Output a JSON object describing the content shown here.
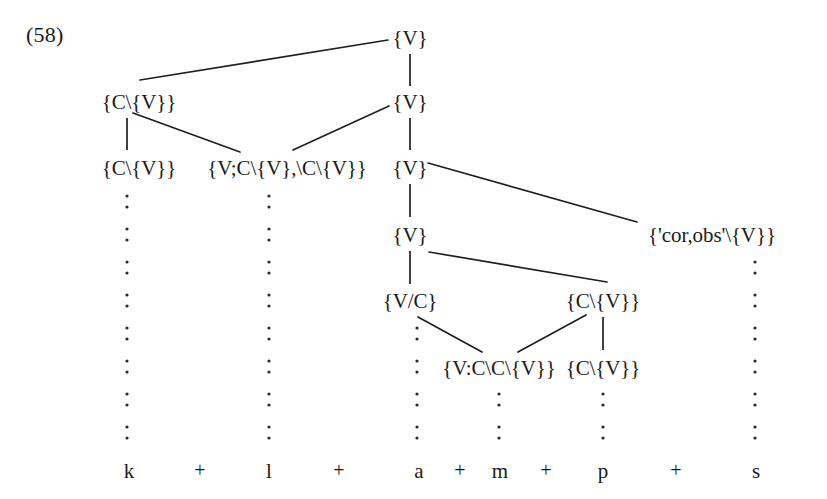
{
  "figure": {
    "example_number": "(58)",
    "ink_color": "#1f1f1f",
    "background_color": "#ffffff"
  },
  "nodes": [
    {
      "id": "n-root-v",
      "label": "{V}",
      "x": 410,
      "y": 38
    },
    {
      "id": "n-c-v-a",
      "label": "{C\\{V}}",
      "x": 139,
      "y": 102
    },
    {
      "id": "n-v-b",
      "label": "{V}",
      "x": 410,
      "y": 102
    },
    {
      "id": "n-c-v-b",
      "label": "{C\\{V}}",
      "x": 139,
      "y": 168
    },
    {
      "id": "n-v-cluster",
      "label": "{V;C\\{V},\\C\\{V}}",
      "x": 287,
      "y": 168
    },
    {
      "id": "n-v-c",
      "label": "{V}",
      "x": 410,
      "y": 168
    },
    {
      "id": "n-v-d",
      "label": "{V}",
      "x": 410,
      "y": 235
    },
    {
      "id": "n-cor-obs",
      "label": "{'cor,obs'\\{V}}",
      "x": 712,
      "y": 235
    },
    {
      "id": "n-v-slash-c",
      "label": "{V/C}",
      "x": 410,
      "y": 301
    },
    {
      "id": "n-c-v-c",
      "label": "{C\\{V}}",
      "x": 603,
      "y": 301
    },
    {
      "id": "n-v-ccv",
      "label": "{V:C\\C\\{V}}",
      "x": 499,
      "y": 368
    },
    {
      "id": "n-c-v-d",
      "label": "{C\\{V}}",
      "x": 603,
      "y": 368
    }
  ],
  "edges": [
    {
      "id": "e-root-to-cva",
      "kind": "diagonal",
      "x1": 388,
      "y1": 40,
      "x2": 140,
      "y2": 80
    },
    {
      "id": "e-root-stem",
      "kind": "stem",
      "x1": 410,
      "y1": 54,
      "x2": 410,
      "y2": 86
    },
    {
      "id": "e-vb-stem",
      "kind": "stem",
      "x1": 410,
      "y1": 118,
      "x2": 410,
      "y2": 150
    },
    {
      "id": "e-vb-to-cluster",
      "kind": "diagonal",
      "x1": 389,
      "y1": 106,
      "x2": 293,
      "y2": 150
    },
    {
      "id": "e-cva-stem",
      "kind": "stem",
      "x1": 127,
      "y1": 118,
      "x2": 127,
      "y2": 150
    },
    {
      "id": "e-cva-to-clu",
      "kind": "diagonal",
      "x1": 133,
      "y1": 113,
      "x2": 240,
      "y2": 152
    },
    {
      "id": "e-vc-stem",
      "kind": "stem",
      "x1": 410,
      "y1": 184,
      "x2": 410,
      "y2": 217
    },
    {
      "id": "e-vc-to-cor",
      "kind": "diagonal",
      "x1": 428,
      "y1": 163,
      "x2": 637,
      "y2": 222
    },
    {
      "id": "e-vd-stem",
      "kind": "stem",
      "x1": 410,
      "y1": 251,
      "x2": 410,
      "y2": 284
    },
    {
      "id": "e-vd-to-cvc",
      "kind": "diagonal",
      "x1": 429,
      "y1": 252,
      "x2": 607,
      "y2": 282
    },
    {
      "id": "e-vslashc-to-ccv",
      "kind": "diagonal",
      "x1": 418,
      "y1": 317,
      "x2": 482,
      "y2": 352
    },
    {
      "id": "e-cvc-to-ccv",
      "kind": "diagonal",
      "x1": 586,
      "y1": 315,
      "x2": 518,
      "y2": 352
    },
    {
      "id": "e-cvc-stem",
      "kind": "stem",
      "x1": 603,
      "y1": 317,
      "x2": 603,
      "y2": 350
    }
  ],
  "dotted_columns": [
    {
      "id": "dc-k",
      "x": 127,
      "y_start": 196,
      "y_end": 450
    },
    {
      "id": "dc-l",
      "x": 269,
      "y_start": 196,
      "y_end": 450
    },
    {
      "id": "dc-a",
      "x": 417,
      "y_start": 328,
      "y_end": 450
    },
    {
      "id": "dc-m",
      "x": 499,
      "y_start": 394,
      "y_end": 450
    },
    {
      "id": "dc-p",
      "x": 603,
      "y_start": 394,
      "y_end": 450
    },
    {
      "id": "dc-s",
      "x": 755,
      "y_start": 262,
      "y_end": 450
    }
  ],
  "terminals": [
    {
      "id": "t-k",
      "label": "k",
      "x": 129,
      "y": 471
    },
    {
      "id": "t-l",
      "label": "l",
      "x": 269,
      "y": 471
    },
    {
      "id": "t-a",
      "label": "a",
      "x": 419,
      "y": 471
    },
    {
      "id": "t-m",
      "label": "m",
      "x": 500,
      "y": 471
    },
    {
      "id": "t-p",
      "label": "p",
      "x": 603,
      "y": 471
    },
    {
      "id": "t-s",
      "label": "s",
      "x": 756,
      "y": 471
    }
  ],
  "separators": [
    {
      "id": "sep-1",
      "label": "+",
      "x": 200,
      "y": 470
    },
    {
      "id": "sep-2",
      "label": "+",
      "x": 339,
      "y": 470
    },
    {
      "id": "sep-3",
      "label": "+",
      "x": 460,
      "y": 470
    },
    {
      "id": "sep-4",
      "label": "+",
      "x": 546,
      "y": 470
    },
    {
      "id": "sep-5",
      "label": "+",
      "x": 676,
      "y": 470
    }
  ],
  "transcription": "k + l + a + m + p + s"
}
